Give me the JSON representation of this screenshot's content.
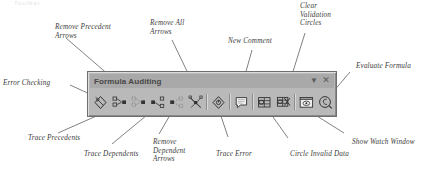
{
  "page": {
    "header_scrap": "Toolbar",
    "background_color": "#ffffff",
    "text_color": "#3b3b3b"
  },
  "toolbar": {
    "title": "Formula Auditing",
    "title_color": "#474747",
    "bar_color": "#b9b9b9",
    "titlebar_color": "#a9a9a9",
    "border_color": "#6e6e6e",
    "dropdown_glyph": "▼",
    "close_glyph": "✕",
    "buttons": [
      {
        "name": "error-checking",
        "tooltip": "Error Checking"
      },
      {
        "name": "trace-precedents",
        "tooltip": "Trace Precedents"
      },
      {
        "name": "remove-precedent-arrows",
        "tooltip": "Remove Precedent Arrows"
      },
      {
        "name": "trace-dependents",
        "tooltip": "Trace Dependents"
      },
      {
        "name": "remove-dependent-arrows",
        "tooltip": "Remove Dependent Arrows"
      },
      {
        "name": "remove-all-arrows",
        "tooltip": "Remove All Arrows"
      },
      {
        "name": "trace-error",
        "tooltip": "Trace Error"
      },
      {
        "name": "new-comment",
        "tooltip": "New Comment"
      },
      {
        "name": "circle-invalid-data",
        "tooltip": "Circle Invalid Data"
      },
      {
        "name": "clear-validation-circles",
        "tooltip": "Clear Validation Circles"
      },
      {
        "name": "show-watch-window",
        "tooltip": "Show Watch Window"
      },
      {
        "name": "evaluate-formula",
        "tooltip": "Evaluate Formula"
      }
    ]
  },
  "callouts": [
    {
      "id": "error-checking",
      "text": "Error Checking"
    },
    {
      "id": "remove-precedent-arrows",
      "text": "Remove Precedent\nArrows"
    },
    {
      "id": "remove-all-arrows",
      "text": "Remove All\nArrows"
    },
    {
      "id": "new-comment",
      "text": "New Comment"
    },
    {
      "id": "clear-validation-circles",
      "text": "Clear\nValidation\nCircles"
    },
    {
      "id": "evaluate-formula",
      "text": "Evaluate Formula"
    },
    {
      "id": "trace-precedents",
      "text": "Trace Precedents"
    },
    {
      "id": "trace-dependents",
      "text": "Trace Dependents"
    },
    {
      "id": "remove-dependent-arrows",
      "text": "Remove\nDependent\nArrows"
    },
    {
      "id": "trace-error",
      "text": "Trace Error"
    },
    {
      "id": "circle-invalid-data",
      "text": "Circle Invalid Data"
    },
    {
      "id": "show-watch-window",
      "text": "Show Watch Window"
    }
  ]
}
